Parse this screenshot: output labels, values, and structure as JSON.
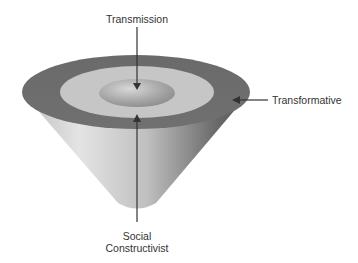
{
  "diagram": {
    "type": "inverted-cone-layers",
    "labels": {
      "top": "Transmission",
      "right": "Transformative",
      "bottom_line1": "Social",
      "bottom_line2": "Constructivist"
    },
    "layers": [
      {
        "name": "Transmission",
        "position": "inner core",
        "color": "#a8a8a8"
      },
      {
        "name": "Social Constructivist",
        "position": "middle ring",
        "color": "#c4c4c4"
      },
      {
        "name": "Transformative",
        "position": "outer ring",
        "color": "#6e6e6e"
      }
    ],
    "colors": {
      "outer_ring": "#6e6e6e",
      "middle_ring": "#c6c6c6",
      "inner_hole": "#a9a9a9",
      "cone_light": "#e2e2e2",
      "cone_dark": "#5c5c5c",
      "arrow": "#333333",
      "text": "#333333"
    }
  }
}
